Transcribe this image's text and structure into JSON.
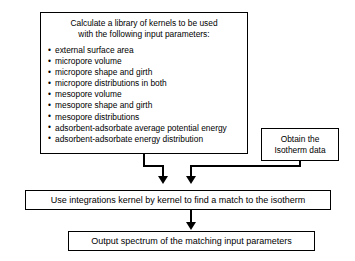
{
  "diagram": {
    "title_line1": "Calculate a library of kernels to be used",
    "title_line2": "with the following input parameters:",
    "bullet_glyph": "•",
    "parameters": [
      "external surface area",
      "micropore volume",
      "micropore shape and girth",
      "micropore distributions in both",
      "mesopore volume",
      "mesopore shape and girth",
      "mesopore distributions",
      "adsorbent-adsorbate average potential energy",
      "adsorbent-adsorbate energy distribution"
    ],
    "isotherm_line1": "Obtain the",
    "isotherm_line2": "Isotherm data",
    "integrations_step": "Use integrations kernel by kernel to find a match to the isotherm",
    "output_step": "Output spectrum of the matching input parameters",
    "colors": {
      "background": "#ffffff",
      "stroke": "#000000",
      "text": "#000000"
    }
  }
}
